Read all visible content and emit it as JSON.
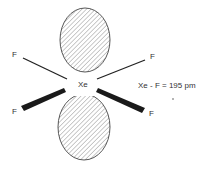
{
  "diagram": {
    "central_atom": "Xe",
    "ligands": [
      {
        "label": "F",
        "position": "upper-left",
        "bond_style": "thin"
      },
      {
        "label": "F",
        "position": "upper-right",
        "bond_style": "thin"
      },
      {
        "label": "F",
        "position": "lower-left",
        "bond_style": "wedge"
      },
      {
        "label": "F",
        "position": "lower-right",
        "bond_style": "wedge"
      }
    ],
    "lone_pairs": [
      {
        "position": "top",
        "fill": "hatched"
      },
      {
        "position": "bottom",
        "fill": "hatched"
      }
    ],
    "annotation": "Xe - F = 195 pm",
    "colors": {
      "line": "#222222",
      "hatch": "#888888",
      "text": "#333333",
      "background": "#ffffff"
    }
  }
}
